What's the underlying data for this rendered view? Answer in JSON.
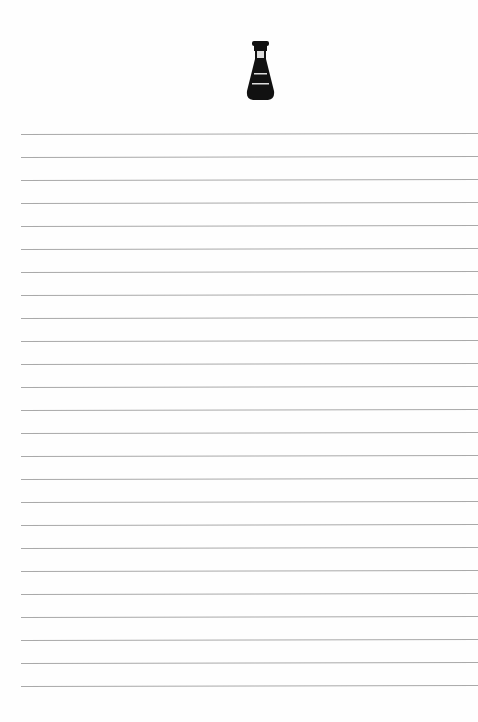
{
  "page": {
    "type": "lined-notepaper",
    "icon": "bottle-icon",
    "line_count": 25,
    "line_start_y": 134,
    "line_spacing": 23,
    "line_color": "#a9a9a9",
    "icon_color": "#111111"
  }
}
